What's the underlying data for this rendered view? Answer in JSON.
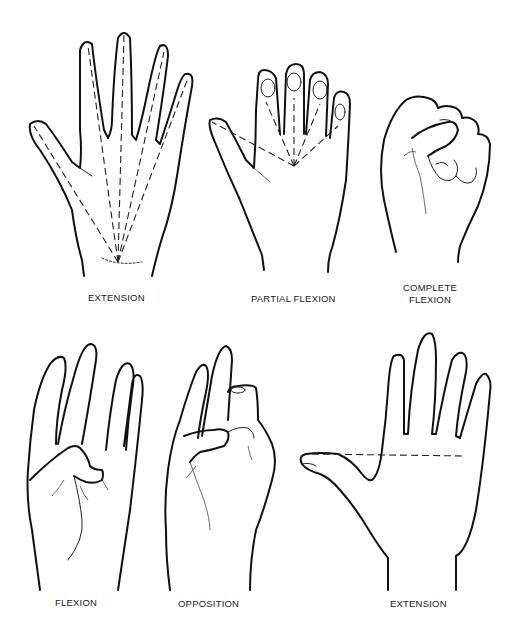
{
  "figure": {
    "background": "#ffffff",
    "line_color": "#111111",
    "panels": [
      {
        "id": "extension-top",
        "label": "EXTENSION",
        "row": 1,
        "column": 1
      },
      {
        "id": "partial-flexion",
        "label": "PARTIAL FLEXION",
        "row": 1,
        "column": 2
      },
      {
        "id": "complete-flexion",
        "label_line1": "COMPLETE",
        "label_line2": "FLEXION",
        "row": 1,
        "column": 3
      },
      {
        "id": "flexion",
        "label": "FLEXION",
        "row": 2,
        "column": 1
      },
      {
        "id": "opposition",
        "label": "OPPOSITION",
        "row": 2,
        "column": 2
      },
      {
        "id": "extension-bottom",
        "label": "EXTENSION",
        "row": 2,
        "column": 3
      }
    ]
  }
}
